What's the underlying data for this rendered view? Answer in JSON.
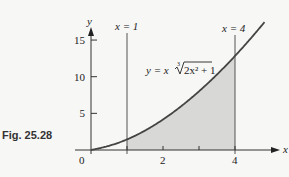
{
  "figure": {
    "caption": "Fig. 25.28"
  },
  "chart_data": {
    "type": "area",
    "title": "",
    "function_label": "y = x∛(2x² + 1)",
    "function_label_parts": {
      "lhs": "y = x",
      "index": "3",
      "radicand": "2x² + 1"
    },
    "xlabel": "x",
    "ylabel": "y",
    "xlim": [
      0,
      5
    ],
    "ylim": [
      0,
      17
    ],
    "x_ticks": [
      0,
      1,
      2,
      3,
      4
    ],
    "x_tick_labels": [
      "0",
      "",
      "2",
      "",
      "4"
    ],
    "y_ticks": [
      5,
      10,
      15
    ],
    "y_tick_labels": [
      "5",
      "10",
      "15"
    ],
    "grid": false,
    "vertical_lines": [
      {
        "x": 1,
        "label": "x = 1"
      },
      {
        "x": 4,
        "label": "x = 4"
      }
    ],
    "shaded_region": {
      "from_x": 1,
      "to_x": 4,
      "under": "curve"
    },
    "series": [
      {
        "name": "y = x∛(2x² + 1)",
        "x": [
          0,
          0.5,
          1,
          1.5,
          2,
          2.5,
          3,
          3.5,
          4,
          4.5,
          4.8
        ],
        "y": [
          0,
          0.57,
          1.44,
          2.57,
          4.16,
          5.89,
          7.96,
          10.24,
          12.83,
          15.63,
          17.3
        ]
      }
    ],
    "colors": {
      "curve": "#444444",
      "shade": "#d8d8d6",
      "axes": "#333333"
    }
  }
}
